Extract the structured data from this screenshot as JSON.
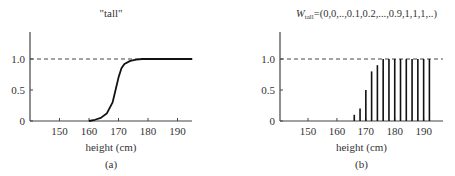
{
  "chart_data": [
    {
      "type": "line",
      "title": "\"tall\"",
      "xlabel": "height (cm)",
      "ylabel": "",
      "caption": "(a)",
      "xticks": [
        150,
        160,
        170,
        180,
        190
      ],
      "yticks": [
        "0",
        "0.5",
        "1.0"
      ],
      "xlim": [
        140,
        195
      ],
      "ylim": [
        0,
        1.4
      ],
      "reference_line": {
        "y": 1.0,
        "style": "dashed"
      },
      "x": [
        160,
        162,
        164,
        166,
        168,
        169,
        170,
        171,
        172,
        174,
        176,
        178,
        180,
        185,
        190,
        195
      ],
      "values": [
        0.0,
        0.02,
        0.05,
        0.12,
        0.3,
        0.5,
        0.7,
        0.85,
        0.92,
        0.97,
        0.99,
        1.0,
        1.0,
        1.0,
        1.0,
        1.0
      ]
    },
    {
      "type": "bar",
      "title": "W_tall=(0,0,..,0.1,0.2,...,0.9,1,1,1,..)",
      "title_main": "W",
      "title_sub": "tall",
      "title_rest": "=(0,0,..,0.1,0.2,...,0.9,1,1,1,..)",
      "xlabel": "height (cm)",
      "ylabel": "",
      "caption": "(b)",
      "xticks": [
        150,
        160,
        170,
        180,
        190
      ],
      "yticks": [
        "0",
        "0.5",
        "1.0"
      ],
      "xlim": [
        140,
        195
      ],
      "ylim": [
        0,
        1.4
      ],
      "reference_line": {
        "y": 1.0,
        "style": "dashed"
      },
      "categories": [
        166,
        168,
        170,
        172,
        174,
        176,
        178,
        180,
        182,
        184,
        186,
        188,
        190,
        192
      ],
      "values": [
        0.1,
        0.2,
        0.5,
        0.8,
        0.9,
        1.0,
        1.0,
        1.0,
        1.0,
        1.0,
        1.0,
        1.0,
        1.0,
        1.0
      ]
    }
  ]
}
